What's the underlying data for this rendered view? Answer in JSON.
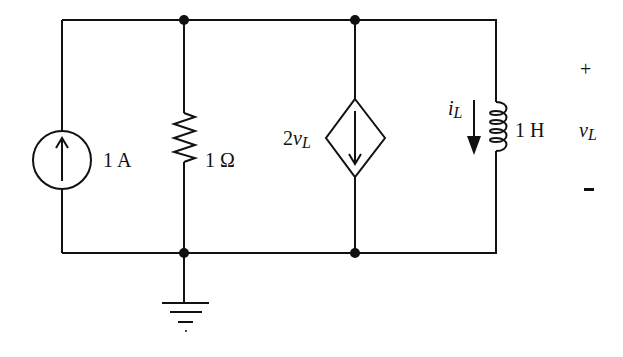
{
  "diagram": {
    "type": "circuit-schematic",
    "components": [
      {
        "id": "current-source",
        "kind": "independent-current-source",
        "label": "1 A",
        "direction": "up"
      },
      {
        "id": "resistor",
        "kind": "resistor",
        "label": "1 Ω"
      },
      {
        "id": "dependent-source",
        "kind": "dependent-current-source",
        "label_coef": "2",
        "label_var": "v",
        "label_sub": "L",
        "direction": "down"
      },
      {
        "id": "inductor",
        "kind": "inductor",
        "label": "1 H"
      }
    ],
    "inductor_current": {
      "var": "i",
      "sub": "L",
      "direction": "down"
    },
    "inductor_voltage": {
      "var": "v",
      "sub": "L",
      "plus": "+",
      "minus": "-"
    },
    "ground": {
      "node": "bottom",
      "label": ""
    }
  },
  "labels": {
    "source": "1 A",
    "resistor": "1 Ω",
    "dep_coef": "2",
    "dep_var": "v",
    "dep_sub": "L",
    "il_var": "i",
    "il_sub": "L",
    "inductor": "1 H",
    "vl_var": "v",
    "vl_sub": "L",
    "plus": "+",
    "minus": "-"
  }
}
